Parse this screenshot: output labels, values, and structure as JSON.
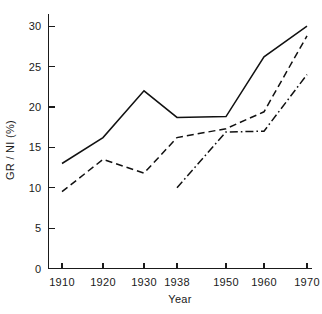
{
  "chart_data": {
    "type": "line",
    "title": "",
    "xlabel": "Year",
    "ylabel": "GR / NI (%)",
    "x": [
      1910,
      1920,
      1930,
      1938,
      1950,
      1960,
      1970
    ],
    "x_tick_labels": [
      "1910",
      "1920",
      "1930",
      "1938",
      "1950",
      "1960",
      "1970"
    ],
    "y_tick_labels": [
      "0",
      "5",
      "10",
      "15",
      "20",
      "25",
      "30"
    ],
    "y_ticks": [
      0,
      5,
      10,
      15,
      20,
      25,
      30
    ],
    "ylim": [
      0,
      31.5
    ],
    "grid": false,
    "legend": "none",
    "series": [
      {
        "name": "solid-series",
        "style": "solid",
        "x": [
          1910,
          1920,
          1930,
          1938,
          1950,
          1960,
          1970
        ],
        "values": [
          13.0,
          16.2,
          22.0,
          18.7,
          18.8,
          26.2,
          30.0
        ]
      },
      {
        "name": "dashed-series",
        "style": "dashed",
        "x": [
          1910,
          1920,
          1930,
          1938,
          1950,
          1960,
          1970
        ],
        "values": [
          9.5,
          13.5,
          11.8,
          16.2,
          17.3,
          19.4,
          28.8
        ]
      },
      {
        "name": "dash-dot-series",
        "style": "dash-dot",
        "x": [
          1938,
          1950,
          1960,
          1970
        ],
        "values": [
          10.0,
          16.9,
          17.0,
          24.0
        ]
      }
    ]
  },
  "axes": {
    "x_title": "Year",
    "y_title": "GR / NI (%)"
  }
}
